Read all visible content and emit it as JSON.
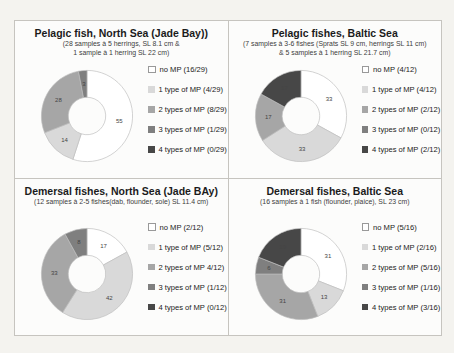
{
  "figure": {
    "background_color": "#f4f3ef",
    "panel_border_color": "#c6c4bf",
    "palette": {
      "no_mp": "#ffffff",
      "mp_1": "#d9d9d9",
      "mp_2": "#a6a6a6",
      "mp_3": "#7f7f7f",
      "mp_4": "#474747"
    }
  },
  "chart_data": [
    {
      "type": "donut",
      "title": "Pelagic fish, North Sea (Jade Bay))",
      "subtitle_lines": [
        "(28 samples à 5 herrings, SL 8.1 cm &",
        "1 sample à 1 herring SL 22 cm)"
      ],
      "legend_position": "right",
      "series": [
        {
          "label": "no MP (16/29)",
          "pct": 55,
          "color_key": "no_mp"
        },
        {
          "label": "1 type of MP (4/29)",
          "pct": 14,
          "color_key": "mp_1"
        },
        {
          "label": "2 types of MP (8/29)",
          "pct": 28,
          "color_key": "mp_2"
        },
        {
          "label": "3 types of MP (1/29)",
          "pct": 3,
          "color_key": "mp_3"
        },
        {
          "label": "4 types of MP (0/29)",
          "pct": 0,
          "color_key": "mp_4"
        }
      ]
    },
    {
      "type": "donut",
      "title": "Pelagic fishes, Baltic Sea",
      "subtitle_lines": [
        "(7 samples à 3-6 fishes (Sprats SL 9 cm, herrings SL 11 cm)",
        "& 5 samples à 1 herring SL 21.7 cm)"
      ],
      "legend_position": "right",
      "series": [
        {
          "label": "no MP (4/12)",
          "pct": 33,
          "color_key": "no_mp"
        },
        {
          "label": "1 type of MP (4/12)",
          "pct": 33,
          "color_key": "mp_1"
        },
        {
          "label": "2 types of MP (2/12)",
          "pct": 17,
          "color_key": "mp_2"
        },
        {
          "label": "3 types of MP (0/12)",
          "pct": 0,
          "color_key": "mp_3"
        },
        {
          "label": "4 types of MP (2/12)",
          "pct": 17,
          "color_key": "mp_4"
        }
      ]
    },
    {
      "type": "donut",
      "title": "Demersal fishes, North Sea (Jade BAy)",
      "subtitle_lines": [
        "(12 samples à 2-5 fishes(dab, flounder, sole) SL 11.4 cm)"
      ],
      "legend_position": "right",
      "series": [
        {
          "label": "no MP (2/12)",
          "pct": 17,
          "color_key": "no_mp"
        },
        {
          "label": "1 type of MP (5/12)",
          "pct": 42,
          "color_key": "mp_1"
        },
        {
          "label": "2 types of MP 4/12)",
          "pct": 33,
          "color_key": "mp_2"
        },
        {
          "label": "3 types of MP (1/12)",
          "pct": 8,
          "color_key": "mp_3"
        },
        {
          "label": "4 types of MP (0/12)",
          "pct": 0,
          "color_key": "mp_4"
        }
      ]
    },
    {
      "type": "donut",
      "title": "Demersal fishes, Baltic Sea",
      "subtitle_lines": [
        "(16 samples à 1 fish (flounder, plaice), SL 23 cm)"
      ],
      "legend_position": "right",
      "series": [
        {
          "label": "no MP (5/16)",
          "pct": 31,
          "color_key": "no_mp"
        },
        {
          "label": "1 type of MP (2/16)",
          "pct": 13,
          "color_key": "mp_1"
        },
        {
          "label": "2 types of MP (5/16)",
          "pct": 31,
          "color_key": "mp_2"
        },
        {
          "label": "3 types of MP (1/16)",
          "pct": 6,
          "color_key": "mp_3"
        },
        {
          "label": "4 types of MP (3/16)",
          "pct": 19,
          "color_key": "mp_4"
        }
      ]
    }
  ]
}
